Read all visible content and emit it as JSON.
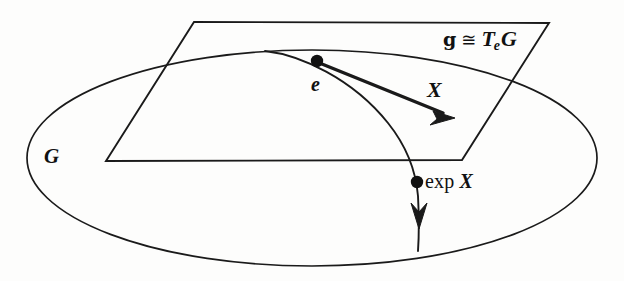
{
  "figure": {
    "kind": "lie-group-exponential-map-diagram",
    "stroke_color": "#1a1a1a",
    "background_color": "#fdfdfc",
    "labels": {
      "group": "G",
      "identity": "e",
      "tangent_vector": "X",
      "exponential_point_prefix": "exp",
      "exponential_point_vector": "X",
      "lie_algebra": "g",
      "congruence_symbol": "≅",
      "tangent_space_T": "T",
      "tangent_space_subscript": "e",
      "tangent_space_G": "G"
    },
    "geometry": {
      "ellipse": {
        "cx": 312,
        "cy": 158,
        "rx": 285,
        "ry": 108
      },
      "plane": {
        "top_left": [
          194,
          22
        ],
        "top_right": [
          549,
          23
        ],
        "bottom_right": [
          462,
          160
        ],
        "bottom_left": [
          106,
          161
        ]
      },
      "identity_point": [
        317,
        61
      ],
      "exp_point": [
        417,
        182
      ],
      "vector_tail": [
        317,
        61
      ],
      "vector_tip": [
        455,
        118
      ],
      "flow_arrow_tip": [
        421,
        228
      ]
    }
  }
}
